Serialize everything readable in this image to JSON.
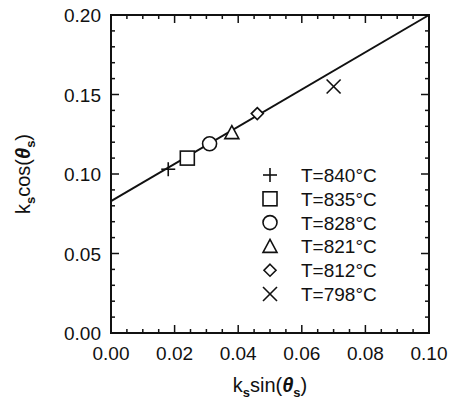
{
  "chart_data": {
    "type": "scatter",
    "title": "",
    "xlabel": "k_s sin(θ_s)",
    "ylabel": "k_s cos(θ_s)",
    "xlim": [
      0.0,
      0.1
    ],
    "ylim": [
      0.0,
      0.2
    ],
    "xticks": [
      "0.00",
      "0.02",
      "0.04",
      "0.06",
      "0.08",
      "0.10"
    ],
    "yticks": [
      "0.00",
      "0.05",
      "0.10",
      "0.15",
      "0.20"
    ],
    "grid": false,
    "legend_position": "lower right (inside)",
    "series": [
      {
        "name": "T=840°C",
        "marker": "plus",
        "x": [
          0.018
        ],
        "y": [
          0.103
        ]
      },
      {
        "name": "T=835°C",
        "marker": "square",
        "x": [
          0.024
        ],
        "y": [
          0.11
        ]
      },
      {
        "name": "T=828°C",
        "marker": "circle",
        "x": [
          0.031
        ],
        "y": [
          0.119
        ]
      },
      {
        "name": "T=821°C",
        "marker": "triangle",
        "x": [
          0.038
        ],
        "y": [
          0.126
        ]
      },
      {
        "name": "T=812°C",
        "marker": "diamond",
        "x": [
          0.046
        ],
        "y": [
          0.138
        ]
      },
      {
        "name": "T=798°C",
        "marker": "x",
        "x": [
          0.07
        ],
        "y": [
          0.155
        ]
      }
    ],
    "fit_line": {
      "x": [
        0.0,
        0.1
      ],
      "y": [
        0.083,
        0.2
      ],
      "slope": 1.17,
      "intercept": 0.083
    }
  },
  "axes": {
    "xlabel_main": "k",
    "xlabel_sub": "s",
    "xlabel_func": "sin(",
    "xlabel_theta": "θ",
    "xlabel_close": ")",
    "ylabel_main": "k",
    "ylabel_sub": "s",
    "ylabel_func": "cos(",
    "ylabel_theta": "θ",
    "ylabel_close": ")"
  }
}
